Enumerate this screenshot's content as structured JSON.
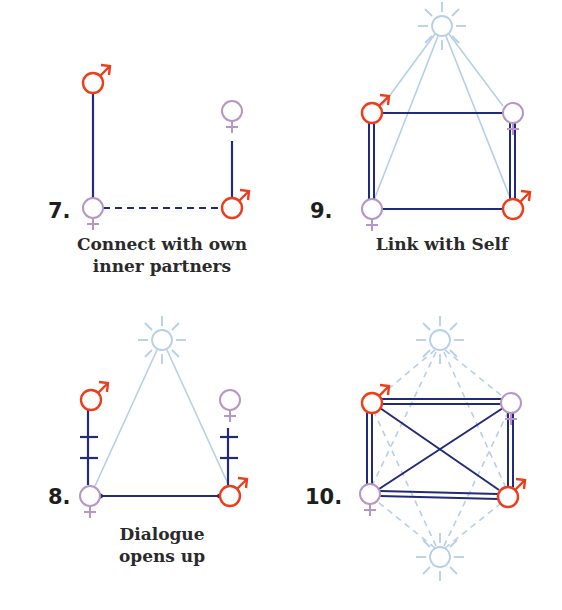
{
  "colors": {
    "male": "#ec3d1c",
    "female": "#b596c6",
    "link": "#232a78",
    "self": "#b6cfe8"
  },
  "panels": [
    {
      "number": "7.",
      "caption_lines": [
        "Connect with own",
        "inner partners"
      ]
    },
    {
      "number": "9.",
      "caption_lines": [
        "Link with Self"
      ]
    },
    {
      "number": "8.",
      "caption_lines": [
        "Dialogue",
        "opens up"
      ]
    },
    {
      "number": "10.",
      "caption_lines": []
    }
  ],
  "symbols": {
    "male": "male-symbol",
    "female": "female-symbol",
    "self": "sun-symbol"
  }
}
